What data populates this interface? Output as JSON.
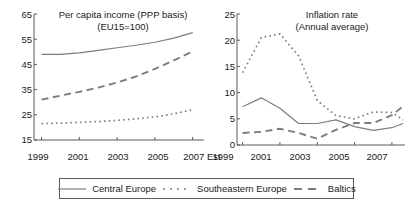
{
  "figure": {
    "background_color": "#ffffff",
    "line_color": "#7d7d7d",
    "axis_color": "#5a5a5a",
    "text_color": "#1a1a1a"
  },
  "legend": {
    "name": "series-legend",
    "position": "bottom-center",
    "entries": [
      {
        "label": "Central Europe",
        "style": "solid"
      },
      {
        "label": "Southeastern Europe",
        "style": "dotted"
      },
      {
        "label": "Baltics",
        "style": "dashed"
      }
    ]
  },
  "chart_data": [
    {
      "type": "line",
      "id": "per-capita-income",
      "title": "Per capita income (PPP basis)\n(EU15=100)",
      "title_line_1": "Per capita income (PPP basis)",
      "title_line_2": "(EU15=100)",
      "xlabel": "",
      "ylabel": "",
      "grid": false,
      "legend_position": "below-figure",
      "x": [
        1999,
        2000,
        2001,
        2002,
        2003,
        2004,
        2005,
        2006,
        2007
      ],
      "xtick_labels": [
        "1999",
        "2001",
        "2003",
        "2005",
        "2007 Est"
      ],
      "xtick_values": [
        1999,
        2001,
        2003,
        2005,
        2007
      ],
      "xlim": [
        1998.6,
        2007.6
      ],
      "ylim": [
        15,
        65
      ],
      "ytick_values": [
        15,
        25,
        35,
        45,
        55,
        65
      ],
      "ytick_labels": [
        "15",
        "25",
        "35",
        "45",
        "55",
        "65"
      ],
      "series": [
        {
          "name": "Central Europe",
          "style": "solid",
          "values": [
            49.0,
            49.0,
            49.6,
            50.6,
            51.6,
            52.6,
            53.8,
            55.4,
            57.6
          ]
        },
        {
          "name": "Southeastern Europe",
          "style": "dotted",
          "values": [
            21.5,
            21.7,
            22.0,
            22.3,
            22.8,
            23.4,
            24.2,
            25.4,
            27.0
          ]
        },
        {
          "name": "Baltics",
          "style": "dashed",
          "values": [
            31.0,
            32.6,
            34.1,
            35.8,
            37.8,
            40.2,
            43.2,
            46.6,
            50.2
          ]
        }
      ]
    },
    {
      "type": "line",
      "id": "inflation-rate",
      "title": "Inflation rate\n(Annual average)",
      "title_line_1": "Inflation rate",
      "title_line_2": "(Annual average)",
      "xlabel": "",
      "ylabel": "",
      "grid": false,
      "legend_position": "below-figure",
      "x": [
        1999,
        2000,
        2001,
        2002,
        2003,
        2004,
        2005,
        2006,
        2007,
        2007.6
      ],
      "xtick_labels": [
        "1999",
        "2001",
        "2003",
        "2005",
        "2007"
      ],
      "xtick_values": [
        1999,
        2001,
        2003,
        2005,
        2007
      ],
      "xlim": [
        1998.7,
        2007.7
      ],
      "ylim": [
        0,
        25
      ],
      "ytick_values": [
        0,
        5,
        10,
        15,
        20,
        25
      ],
      "ytick_labels": [
        "0",
        "5",
        "10",
        "15",
        "20",
        "25"
      ],
      "series": [
        {
          "name": "Central Europe",
          "style": "solid",
          "values": [
            7.3,
            9.0,
            7.0,
            4.1,
            4.1,
            4.8,
            3.5,
            2.8,
            3.3,
            4.1
          ]
        },
        {
          "name": "Southeastern Europe",
          "style": "dotted",
          "values": [
            13.8,
            20.5,
            21.2,
            17.0,
            8.5,
            5.6,
            5.0,
            6.3,
            6.2,
            4.8
          ]
        },
        {
          "name": "Baltics",
          "style": "dashed",
          "values": [
            2.3,
            2.5,
            3.1,
            2.3,
            1.2,
            2.9,
            4.2,
            4.2,
            5.7,
            7.4
          ]
        }
      ]
    }
  ]
}
